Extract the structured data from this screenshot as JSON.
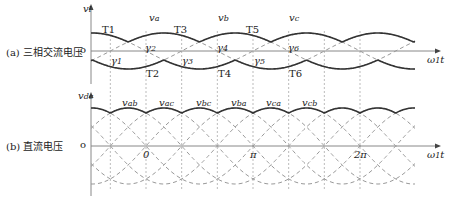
{
  "panels": {
    "a": {
      "label": "(a) 三相交流电压",
      "y_axis": "v",
      "y_sub": "l",
      "origin": "o",
      "x_axis": "ω",
      "x_sub": "1",
      "x_tail": "t"
    },
    "b": {
      "label": "(b) 直流电压",
      "y_axis": "v",
      "y_sub": "dc",
      "origin": "o",
      "x_axis": "ω",
      "x_sub": "1",
      "x_tail": "t"
    }
  },
  "labels_a": {
    "phases": [
      {
        "text": "v",
        "sub": "a",
        "x": 149,
        "y": 12
      },
      {
        "text": "v",
        "sub": "b",
        "x": 218,
        "y": 12
      },
      {
        "text": "v",
        "sub": "c",
        "x": 289,
        "y": 12
      }
    ],
    "thyristors": [
      {
        "text": "T1",
        "x": 102,
        "y": 24
      },
      {
        "text": "T3",
        "x": 174,
        "y": 24
      },
      {
        "text": "T5",
        "x": 246,
        "y": 24
      },
      {
        "text": "T2",
        "x": 146,
        "y": 68
      },
      {
        "text": "T4",
        "x": 218,
        "y": 68
      },
      {
        "text": "T6",
        "x": 289,
        "y": 68
      }
    ],
    "gammas": [
      {
        "text": "γ",
        "sub": "1",
        "x": 111,
        "y": 55
      },
      {
        "text": "γ",
        "sub": "2",
        "x": 145,
        "y": 42
      },
      {
        "text": "γ",
        "sub": "3",
        "x": 182,
        "y": 55
      },
      {
        "text": "γ",
        "sub": "4",
        "x": 217,
        "y": 42
      },
      {
        "text": "γ",
        "sub": "5",
        "x": 254,
        "y": 55
      },
      {
        "text": "γ",
        "sub": "6",
        "x": 288,
        "y": 42
      }
    ]
  },
  "labels_b": {
    "line_voltages": [
      {
        "text": "v",
        "sub": "ab",
        "x": 122,
        "y": 97
      },
      {
        "text": "v",
        "sub": "ac",
        "x": 159,
        "y": 97
      },
      {
        "text": "v",
        "sub": "bc",
        "x": 196,
        "y": 97
      },
      {
        "text": "v",
        "sub": "ba",
        "x": 231,
        "y": 97
      },
      {
        "text": "v",
        "sub": "ca",
        "x": 266,
        "y": 97
      },
      {
        "text": "v",
        "sub": "cb",
        "x": 302,
        "y": 97
      }
    ],
    "ticks": [
      {
        "text": "0",
        "x": 143,
        "y": 149
      },
      {
        "text": "π",
        "x": 250,
        "y": 149
      },
      {
        "text": "2π",
        "x": 354,
        "y": 149
      }
    ]
  },
  "chart_data": {
    "type": "line",
    "panels": [
      {
        "name": "(a) 三相交流电压",
        "ylabel": "v_l",
        "xlabel": "ω1 t",
        "series": [
          {
            "name": "v_a",
            "phase_deg": 0
          },
          {
            "name": "v_b",
            "phase_deg": -120
          },
          {
            "name": "v_c",
            "phase_deg": 120
          }
        ],
        "annotations": [
          "T1",
          "T2",
          "T3",
          "T4",
          "T5",
          "T6",
          "γ1",
          "γ2",
          "γ3",
          "γ4",
          "γ5",
          "γ6"
        ],
        "x_range_rad": [
          -1.05,
          7.9
        ]
      },
      {
        "name": "(b) 直流电压",
        "ylabel": "v_dc",
        "xlabel": "ω1 t",
        "series": [
          {
            "name": "v_ab"
          },
          {
            "name": "v_ac"
          },
          {
            "name": "v_bc"
          },
          {
            "name": "v_ba"
          },
          {
            "name": "v_ca"
          },
          {
            "name": "v_cb"
          }
        ],
        "x_ticks": [
          "0",
          "π",
          "2π"
        ]
      }
    ]
  },
  "geometry": {
    "x0": 146,
    "period_px": 214,
    "a_zero": 51,
    "a_amp": 18,
    "b_zero": 146,
    "b_amp": 38,
    "x_start": 91,
    "x_end": 415
  }
}
